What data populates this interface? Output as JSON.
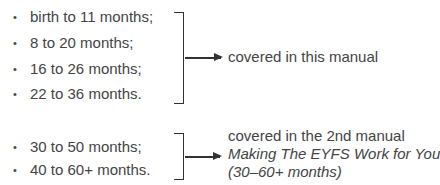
{
  "group1": {
    "items": [
      "birth to 11 months;",
      "8 to 20 months;",
      "16 to 26 months;",
      "22 to 36 months."
    ],
    "note": "covered in this manual"
  },
  "group2": {
    "items": [
      "30 to 50 months;",
      "40 to 60+ months."
    ],
    "note_line1": "covered in the 2nd manual",
    "note_line2": "Making The EYFS Work for You",
    "note_line3": "(30–60+ months)"
  },
  "bullet": "•"
}
